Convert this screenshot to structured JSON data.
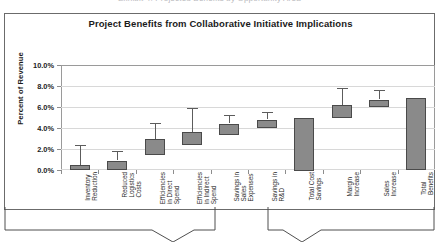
{
  "top_clip_text": "Exhibit 4: Projected Benefits by Opportunity Area",
  "chart_data": {
    "type": "bar",
    "title": "Project Benefits from Collaborative Initiative Implications",
    "xlabel": "",
    "ylabel": "Percent of Revenue",
    "ylim": [
      0,
      10
    ],
    "ytick_values": [
      0,
      2,
      4,
      6,
      8,
      10
    ],
    "ytick_labels": [
      "0.0%",
      "2.0%",
      "4.0%",
      "6.0%",
      "8.0%",
      "10.0%"
    ],
    "grid": true,
    "legend": "none",
    "categories": [
      "Inventory Reduction",
      "Reduced Logistics Costs",
      "Efficiencies in Direct Spend",
      "Efficiencies in Indirect Spend",
      "Savings in Sales Expenses",
      "Savings in R&D",
      "Total Cost Savings",
      "Margin Increase",
      "Sales Increase",
      "Total Benefits"
    ],
    "category_lines": [
      [
        "Inventory",
        "Reduction"
      ],
      [
        "Reduced",
        "Logistics",
        "Costs"
      ],
      [
        "Efficiencies",
        "in Direct",
        "Spend"
      ],
      [
        "Efficiencies",
        "in Indirect",
        "Spend"
      ],
      [
        "Savings in",
        "Sales",
        "Expenses"
      ],
      [
        "Savings in",
        "R&D"
      ],
      [
        "Total Cost",
        "Savings"
      ],
      [
        "Margin",
        "Increase"
      ],
      [
        "Sales",
        "Increase"
      ],
      [
        "Total",
        "Benefits"
      ]
    ],
    "series": [
      {
        "name": "Benefit range (box) with upper estimate (whisker)",
        "box_low": [
          0.0,
          0.0,
          1.5,
          2.4,
          3.4,
          4.0,
          0.0,
          5.0,
          6.0,
          0.0
        ],
        "box_high": [
          0.5,
          0.9,
          3.0,
          3.6,
          4.4,
          4.8,
          5.0,
          6.2,
          6.7,
          6.9
        ],
        "whisker_high": [
          2.4,
          1.8,
          4.5,
          5.9,
          5.2,
          5.5,
          null,
          7.8,
          7.6,
          null
        ]
      }
    ],
    "colors": {
      "bar_fill": "#8a8a8a",
      "bar_edge": "#4a4a4a",
      "whisker": "#5c5c5c",
      "gridline": "#d8d8d8",
      "axis": "#6f6f6f",
      "frame": "#6b6b6b",
      "text": "#1b1b1b"
    }
  },
  "callouts": [
    {
      "name": "cost-savings-funnel"
    },
    {
      "name": "total-benefits-funnel"
    }
  ]
}
